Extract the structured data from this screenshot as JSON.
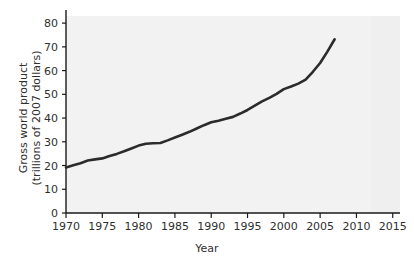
{
  "chart_data": {
    "type": "line",
    "title": "",
    "xlabel": "Year",
    "ylabel_line1": "Gross world product",
    "ylabel_line2": "(trillions of 2007 dollars)",
    "ylabel": "Gross world product (trillions of 2007 dollars)",
    "xlim": [
      1970,
      2016
    ],
    "ylim": [
      0,
      83
    ],
    "xticks": [
      1970,
      1975,
      1980,
      1985,
      1990,
      1995,
      2000,
      2005,
      2010,
      2015
    ],
    "xtick_labels": [
      "1970",
      "1975",
      "1980",
      "1985",
      "1990",
      "1995",
      "2000",
      "2005",
      "2010",
      "2015"
    ],
    "yticks": [
      0,
      10,
      20,
      30,
      40,
      50,
      60,
      70,
      80
    ],
    "ytick_labels": [
      "0",
      "10",
      "20",
      "30",
      "40",
      "50",
      "60",
      "70",
      "80"
    ],
    "grid": false,
    "legend": false,
    "legend_position": "none",
    "line_color": "#2b2b2b",
    "line_width": 2.6,
    "plot_background": "#f2f2f2",
    "figure_background": "#ffffff",
    "axis_color": "#1a1a1a",
    "x": [
      1970,
      1971,
      1972,
      1973,
      1974,
      1975,
      1976,
      1977,
      1978,
      1979,
      1980,
      1981,
      1982,
      1983,
      1984,
      1985,
      1986,
      1987,
      1988,
      1989,
      1990,
      1991,
      1992,
      1993,
      1994,
      1995,
      1996,
      1997,
      1998,
      1999,
      2000,
      2001,
      2002,
      2003,
      2004,
      2005,
      2006,
      2007
    ],
    "values": [
      19.2,
      20.1,
      21.0,
      22.1,
      22.6,
      23.0,
      24.0,
      24.9,
      26.0,
      27.2,
      28.4,
      29.2,
      29.4,
      29.5,
      30.6,
      31.8,
      33.0,
      34.2,
      35.6,
      37.0,
      38.2,
      38.9,
      39.7,
      40.5,
      41.9,
      43.4,
      45.2,
      47.0,
      48.5,
      50.2,
      52.2,
      53.3,
      54.5,
      56.2,
      59.5,
      63.2,
      68.0,
      73.2
    ],
    "series": [
      {
        "name": "Gross world product",
        "values": [
          19.2,
          20.1,
          21.0,
          22.1,
          22.6,
          23.0,
          24.0,
          24.9,
          26.0,
          27.2,
          28.4,
          29.2,
          29.4,
          29.5,
          30.6,
          31.8,
          33.0,
          34.2,
          35.6,
          37.0,
          38.2,
          38.9,
          39.7,
          40.5,
          41.9,
          43.4,
          45.2,
          47.0,
          48.5,
          50.2,
          52.2,
          53.3,
          54.5,
          56.2,
          59.5,
          63.2,
          68.0,
          73.2
        ]
      }
    ],
    "annotations": []
  }
}
